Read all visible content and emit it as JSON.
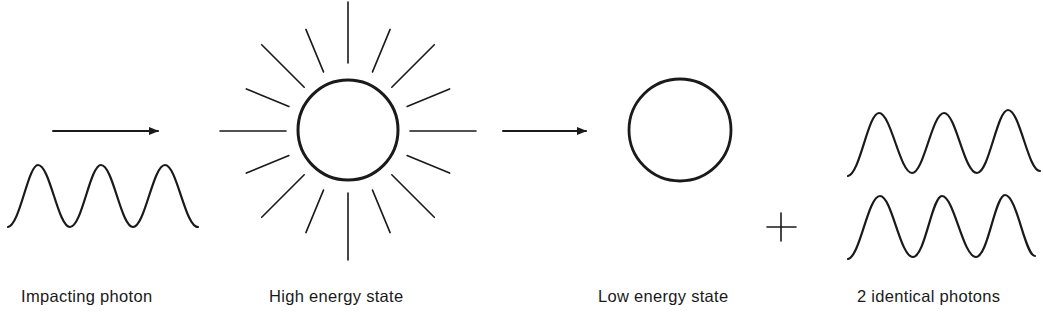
{
  "diagram": {
    "stroke_color": "#1a1a1a",
    "background_color": "#ffffff",
    "labels": {
      "impacting_photon": "Impacting photon",
      "high_energy_state": "High energy state",
      "low_energy_state": "Low energy state",
      "identical_photons": "2 identical photons"
    },
    "plus_symbol": "+",
    "stages": [
      {
        "id": "impacting-photon",
        "elements": [
          "arrow-right",
          "sine-wave"
        ]
      },
      {
        "id": "high-energy-state",
        "elements": [
          "circle",
          "radiating-rays"
        ],
        "ray_count": 16
      },
      {
        "id": "transition",
        "elements": [
          "arrow-right"
        ]
      },
      {
        "id": "low-energy-state",
        "elements": [
          "circle"
        ]
      },
      {
        "id": "plus",
        "elements": [
          "plus-sign"
        ]
      },
      {
        "id": "identical-photons",
        "elements": [
          "sine-wave",
          "sine-wave"
        ]
      }
    ]
  }
}
